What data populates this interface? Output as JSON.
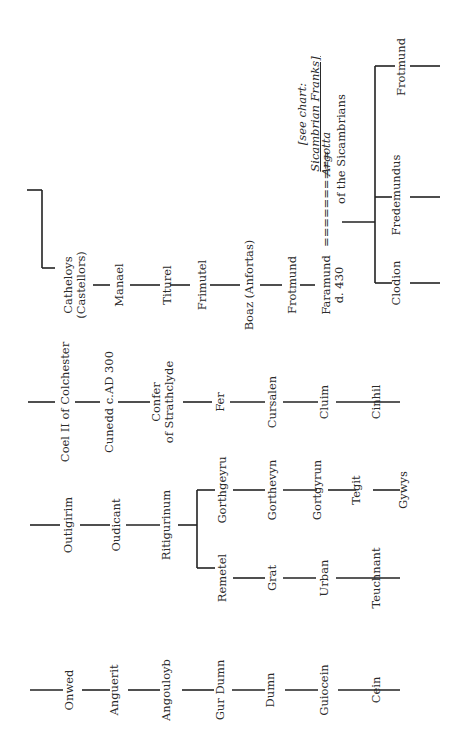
{
  "diagram": {
    "type": "genealogy-chart",
    "orientation": "rotated-90-ccw",
    "line_color": "#222222",
    "text_color": "#2a2a2a",
    "lineages": [
      {
        "id": "lineage-1",
        "names": [
          "Onwed",
          "Anguerit",
          "Angouloyb",
          "Gur Dumn",
          "Dumn",
          "Guiocein",
          "Cein"
        ]
      },
      {
        "id": "lineage-2",
        "names": [
          "Outigirim",
          "Oudicant",
          "Ritigurinum"
        ],
        "branches": [
          {
            "names": [
              "Remetel",
              "Grat",
              "Urban",
              "Teuchnant"
            ]
          },
          {
            "names": [
              "Gorthgeyru",
              "Gorthevyn",
              "Gortgyrun",
              "Tegit",
              "Gywys"
            ]
          }
        ]
      },
      {
        "id": "lineage-3",
        "names": [
          "Coel II of Colchester",
          "Cunedd c.AD 300",
          "Confer of Strathclyde",
          "Fer",
          "Cursalen",
          "Cluim",
          "Cinhil"
        ]
      },
      {
        "id": "lineage-4",
        "names": [
          "Catheloys (Castellors)",
          "Manael",
          "Piturel",
          "Frimutel",
          "Boaz (Anfortas)",
          "Frotmund",
          "Faramund d. 430"
        ],
        "marriage": {
          "spouse": "Argotta",
          "spouse_note": "of the Sicambrians",
          "connector": "==========",
          "reference": {
            "prefix": "[see chart:",
            "link": "Sicambrian Franks",
            "suffix": "]"
          }
        },
        "children": [
          "Clodion",
          "Fredemundus",
          "Frotmund"
        ]
      }
    ]
  },
  "labels": {
    "onwed": "Onwed",
    "anguerit": "Anguerit",
    "angouloyb": "Angouloyb",
    "gur_dumn": "Gur Dumn",
    "dumn": "Dumn",
    "guiocein": "Guiocein",
    "cein": "Cein",
    "outigirim": "Outigirim",
    "oudicant": "Oudicant",
    "ritigurinum": "Ritigurinum",
    "remetel": "Remetel",
    "grat": "Grat",
    "urban": "Urban",
    "teuchnant": "Teuchnant",
    "gorthgeyru": "Gorthgeyru",
    "gorthevyn": "Gorthevyn",
    "gortgyrun": "Gortgyrun",
    "tegit": "Tegit",
    "gywys": "Gywys",
    "coel": "Coel II of Colchester",
    "cunedd": "Cunedd c.AD 300",
    "confer_1": "Confer",
    "confer_2": "of Strathclyde",
    "fer": "Fer",
    "cursalen": "Cursalen",
    "cluim": "Cluim",
    "cinhil": "Cinhil",
    "catheloys_1": "Catheloys",
    "catheloys_2": "(Castellors)",
    "manael": "Manael",
    "piturel": "Titurel",
    "frimutel": "Frimutel",
    "boaz": "Boaz (Anfortas)",
    "frotmund_1": "Frotmund",
    "faramund_1": "Faramund",
    "faramund_2": "d. 430",
    "marriage_eq": "==========",
    "argotta": "Argotta",
    "sicambrians": "of the Sicambrians",
    "see_chart": "[see chart:",
    "sicambrian_franks": "Sicambrian Franks]",
    "clodion": "Clodion",
    "fredemundus": "Fredemundus",
    "frotmund_2": "Frotmund"
  }
}
